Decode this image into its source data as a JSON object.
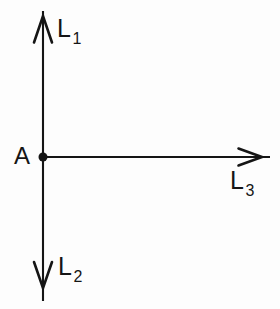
{
  "figure": {
    "background_color": "#fdfdfd",
    "ink_color": "#151515",
    "width": 280,
    "height": 309
  },
  "labels": {
    "point_a": "A",
    "ray_up_base": "L",
    "ray_up_sub": "1",
    "ray_down_base": "L",
    "ray_down_sub": "2",
    "ray_right_base": "L",
    "ray_right_sub": "3"
  },
  "geometry": {
    "origin": {
      "x": 43,
      "y": 157
    },
    "dot_radius": 4.5,
    "vertical_line": {
      "x": 43,
      "y_top": 11,
      "y_bottom": 301
    },
    "horizontal_line": {
      "y": 157,
      "x_left": 43,
      "x_right": 270
    },
    "arrow_up": {
      "tip_x": 43,
      "tip_y": 16,
      "spread": 9,
      "length": 26
    },
    "arrow_down": {
      "tip_x": 43,
      "tip_y": 288,
      "spread": 9,
      "length": 26
    },
    "arrow_right": {
      "tip_x": 262,
      "tip_y": 157,
      "spread": 8,
      "length": 24
    },
    "stroke_width": 2.1
  }
}
